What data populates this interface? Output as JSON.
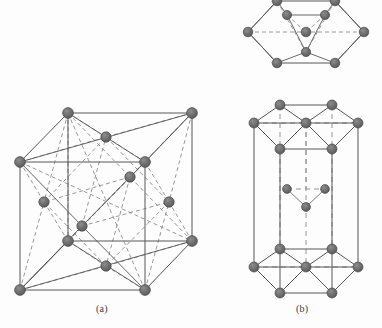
{
  "figure": {
    "background_color": "#fdfdfd",
    "atom_color": "#6b6b6b",
    "atom_stroke_color": "#4a4a4a",
    "edge_color": "#5a5a5a",
    "dashed_color": "#777777",
    "labels": {
      "panel_a": "(a)",
      "panel_b": "(b)"
    }
  },
  "panels": [
    {
      "id": "a",
      "label": "(a)",
      "structure_name": "face-centered cubic",
      "shape": "cube",
      "atom_count": 14,
      "corner_atoms": 8,
      "face_center_atoms": 6,
      "atom_radius": 5.2,
      "geometry": {
        "front_bottom_left": [
          20,
          290
        ],
        "front_bottom_right": [
          145,
          290
        ],
        "front_top_left": [
          20,
          162
        ],
        "front_top_right": [
          145,
          162
        ],
        "back_bottom_left": [
          68,
          241
        ],
        "back_bottom_right": [
          192,
          241
        ],
        "back_top_left": [
          68,
          113
        ],
        "back_top_right": [
          192,
          113
        ]
      },
      "face_centers": {
        "front": [
          82,
          226
        ],
        "back": [
          130,
          177
        ],
        "top": [
          106,
          137
        ],
        "bottom": [
          106,
          266
        ],
        "left": [
          44,
          202
        ],
        "right": [
          169,
          202
        ]
      }
    },
    {
      "id": "b",
      "label": "(b)",
      "structure_name": "hexagonal close-packed",
      "views": [
        {
          "view_name": "top-plan-hexagon",
          "atom_count": 10,
          "hexagon_corner_atoms": 6,
          "hexagon_center_atoms": 1,
          "inner_triangle_atoms": 3,
          "atom_radius": 4.6,
          "center": [
            306,
            32
          ],
          "radius_x": 58,
          "radius_y": 32
        },
        {
          "view_name": "hexagonal-prism",
          "atom_count": 17,
          "top_face_atoms": 7,
          "bottom_face_atoms": 7,
          "mid_plane_atoms": 3,
          "atom_radius": 5.0,
          "top_center": [
            306,
            123
          ],
          "bottom_center": [
            306,
            267
          ],
          "radius_x": 52,
          "radius_y": 26,
          "height": 144
        }
      ]
    }
  ]
}
